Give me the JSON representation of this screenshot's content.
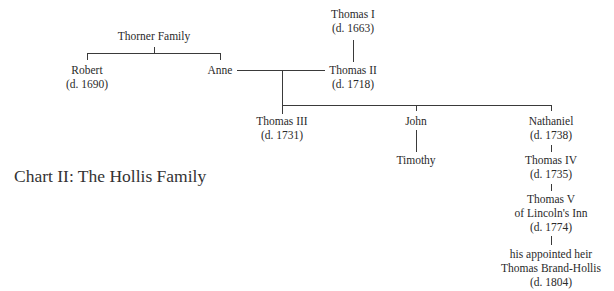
{
  "title": "Chart II: The Hollis Family",
  "nodes": {
    "thomas1": {
      "name": "Thomas I",
      "dates": "(d. 1663)"
    },
    "thomas2": {
      "name": "Thomas II",
      "dates": "(d. 1718)"
    },
    "thorner": {
      "name": "Thorner Family"
    },
    "robert": {
      "name": "Robert",
      "dates": "(d. 1690)"
    },
    "anne": {
      "name": "Anne"
    },
    "thomas3": {
      "name": "Thomas III",
      "dates": "(d. 1731)"
    },
    "john": {
      "name": "John"
    },
    "timothy": {
      "name": "Timothy"
    },
    "nathaniel": {
      "name": "Nathaniel",
      "dates": "(d. 1738)"
    },
    "thomas4": {
      "name": "Thomas IV",
      "dates": "(d. 1735)"
    },
    "thomas5": {
      "name": "Thomas V",
      "note": "of Lincoln's Inn",
      "dates": "(d. 1774)"
    },
    "brandhollis": {
      "note": "his appointed heir",
      "name": "Thomas Brand-Hollis",
      "dates": "(d. 1804)"
    }
  },
  "relationships": [
    {
      "type": "parent-child",
      "parent": "Thomas I",
      "child": "Thomas II"
    },
    {
      "type": "parent-children",
      "parent": "Thorner Family",
      "children": [
        "Robert",
        "Anne"
      ]
    },
    {
      "type": "marriage",
      "spouses": [
        "Anne",
        "Thomas II"
      ]
    },
    {
      "type": "parent-children",
      "parents": [
        "Anne",
        "Thomas II"
      ],
      "children": [
        "Thomas III",
        "John",
        "Nathaniel"
      ]
    },
    {
      "type": "parent-child",
      "parent": "John",
      "child": "Timothy"
    },
    {
      "type": "parent-child",
      "parent": "Nathaniel",
      "child": "Thomas IV"
    },
    {
      "type": "parent-child",
      "parent": "Thomas IV",
      "child": "Thomas V"
    },
    {
      "type": "appointed-heir",
      "from": "Thomas V",
      "to": "Thomas Brand-Hollis"
    }
  ]
}
